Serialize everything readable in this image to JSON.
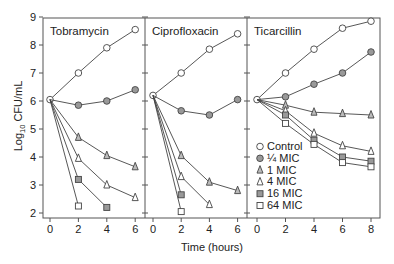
{
  "chart_data": {
    "type": "line",
    "ylabel": "Log10 CFU/mL",
    "ylabel_main": "Log",
    "ylabel_sub": "10",
    "ylabel_rest": " CFU/mL",
    "xlabel": "Time (hours)",
    "ylim": [
      2,
      9
    ],
    "yticks": [
      2,
      3,
      4,
      5,
      6,
      7,
      8,
      9
    ],
    "legend": {
      "position": "inside lower-left of Ticarcillin panel",
      "entries": [
        {
          "label": "Control",
          "marker": "open-circle"
        },
        {
          "label": "¼ MIC",
          "marker": "filled-circle"
        },
        {
          "label": "1 MIC",
          "marker": "triangle-tall"
        },
        {
          "label": "4 MIC",
          "marker": "open-triangle"
        },
        {
          "label": "16 MIC",
          "marker": "filled-square"
        },
        {
          "label": "64 MIC",
          "marker": "open-square"
        }
      ]
    },
    "panels": [
      {
        "title": "Tobramycin",
        "xticks": [
          0,
          2,
          4,
          6
        ],
        "xlim": [
          0,
          6
        ],
        "series": [
          {
            "name": "Control",
            "x": [
              0,
              2,
              4,
              6
            ],
            "values": [
              6.05,
              7.0,
              7.9,
              8.55
            ]
          },
          {
            "name": "¼ MIC",
            "x": [
              0,
              2,
              4,
              6
            ],
            "values": [
              6.05,
              5.85,
              6.0,
              6.4
            ]
          },
          {
            "name": "1 MIC",
            "x": [
              0,
              2,
              4,
              6
            ],
            "values": [
              6.05,
              4.7,
              4.05,
              3.65
            ]
          },
          {
            "name": "4 MIC",
            "x": [
              0,
              2,
              4,
              6
            ],
            "values": [
              6.05,
              3.95,
              3.0,
              2.55
            ]
          },
          {
            "name": "16 MIC",
            "x": [
              0,
              2,
              4
            ],
            "values": [
              6.05,
              3.2,
              2.2
            ]
          },
          {
            "name": "64 MIC",
            "x": [
              0,
              2
            ],
            "values": [
              6.05,
              2.25
            ]
          }
        ]
      },
      {
        "title": "Ciprofloxacin",
        "xticks": [
          0,
          2,
          4,
          6
        ],
        "xlim": [
          0,
          6
        ],
        "series": [
          {
            "name": "Control",
            "x": [
              0,
              2,
              4,
              6
            ],
            "values": [
              6.2,
              7.0,
              7.85,
              8.4
            ]
          },
          {
            "name": "¼ MIC",
            "x": [
              0,
              2,
              4,
              6
            ],
            "values": [
              6.2,
              5.65,
              5.5,
              6.05
            ]
          },
          {
            "name": "1 MIC",
            "x": [
              0,
              2,
              4,
              6
            ],
            "values": [
              6.2,
              4.05,
              3.1,
              2.8
            ]
          },
          {
            "name": "4 MIC",
            "x": [
              0,
              2,
              4
            ],
            "values": [
              6.2,
              3.3,
              2.3
            ]
          },
          {
            "name": "16 MIC",
            "x": [
              0,
              2
            ],
            "values": [
              6.2,
              2.65
            ]
          },
          {
            "name": "64 MIC",
            "x": [
              0,
              2
            ],
            "values": [
              6.2,
              2.05
            ]
          }
        ]
      },
      {
        "title": "Ticarcillin",
        "xticks": [
          0,
          2,
          4,
          6,
          8
        ],
        "xlim": [
          0,
          8
        ],
        "series": [
          {
            "name": "Control",
            "x": [
              0,
              2,
              4,
              6,
              8
            ],
            "values": [
              6.05,
              7.0,
              7.85,
              8.6,
              8.85
            ]
          },
          {
            "name": "¼ MIC",
            "x": [
              0,
              2,
              4,
              6,
              8
            ],
            "values": [
              6.05,
              6.15,
              6.6,
              7.0,
              7.75
            ]
          },
          {
            "name": "1 MIC",
            "x": [
              0,
              2,
              4,
              6,
              8
            ],
            "values": [
              6.05,
              5.85,
              5.6,
              5.55,
              5.5
            ]
          },
          {
            "name": "4 MIC",
            "x": [
              0,
              2,
              4,
              6,
              8
            ],
            "values": [
              6.05,
              5.65,
              4.85,
              4.4,
              4.2
            ]
          },
          {
            "name": "16 MIC",
            "x": [
              0,
              2,
              4,
              6,
              8
            ],
            "values": [
              6.05,
              5.5,
              4.6,
              4.0,
              3.85
            ]
          },
          {
            "name": "64 MIC",
            "x": [
              0,
              2,
              4,
              6,
              8
            ],
            "values": [
              6.05,
              5.2,
              4.45,
              3.8,
              3.65
            ]
          }
        ]
      }
    ],
    "grid": false
  }
}
